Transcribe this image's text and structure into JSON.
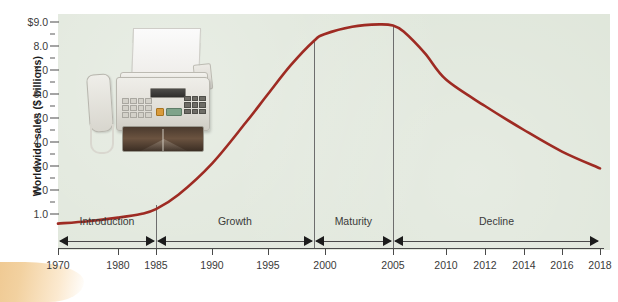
{
  "chart_data": {
    "type": "line",
    "title": "",
    "subtitle": "",
    "xlabel": "",
    "ylabel": "Worldwide sales ($ billions)",
    "grid": false,
    "legend": "none",
    "ylim": [
      0.0,
      9.0
    ],
    "y_ticks": [
      "$9.0",
      "8.0",
      "7.0",
      "6.0",
      "5.0",
      "4.0",
      "3.0",
      "2.0",
      "1.0"
    ],
    "y_tick_values": [
      9.0,
      8.0,
      7.0,
      6.0,
      5.0,
      4.0,
      3.0,
      2.0,
      1.0
    ],
    "y_minor_ticks": [
      8.5,
      7.5,
      6.5,
      5.5,
      4.5,
      3.5,
      2.5,
      1.5
    ],
    "x_ticks": [
      "1970",
      "1980",
      "1985",
      "1990",
      "1995",
      "2000",
      "2005",
      "2010",
      "2012",
      "2014",
      "2016",
      "2018"
    ],
    "x_tick_values": [
      1970,
      1980,
      1985,
      1990,
      1995,
      2000,
      2005,
      2010,
      2012,
      2014,
      2016,
      2018
    ],
    "series": [
      {
        "name": "Worldwide fax machine sales",
        "color": "#9e2b23",
        "x": [
          1970,
          1975,
          1980,
          1983,
          1985,
          1987,
          1990,
          1993,
          1995,
          1997,
          1999,
          2000,
          2002,
          2004,
          2005,
          2006,
          2008,
          2010,
          2012,
          2014,
          2016,
          2018
        ],
        "values": [
          0.6,
          0.7,
          0.85,
          1.0,
          1.2,
          1.8,
          3.1,
          4.8,
          6.0,
          7.2,
          8.2,
          8.5,
          8.8,
          8.9,
          8.85,
          8.6,
          7.7,
          6.6,
          5.5,
          4.5,
          3.6,
          2.9
        ]
      }
    ],
    "annotations": [
      {
        "name": "stage-introduction",
        "label": "Introduction",
        "x_start": 1970,
        "x_end": 1985
      },
      {
        "name": "stage-growth",
        "label": "Growth",
        "x_start": 1985,
        "x_end": 1999
      },
      {
        "name": "stage-maturity",
        "label": "Maturity",
        "x_start": 1999,
        "x_end": 2005
      },
      {
        "name": "stage-decline",
        "label": "Decline",
        "x_start": 2005,
        "x_end": 2018
      }
    ],
    "dividers": [
      1985,
      1999,
      2005
    ]
  },
  "axes": {
    "y_title": "Worldwide sales ($ billions)",
    "y_labels": [
      "$9.0",
      "8.0",
      "7.0",
      "6.0",
      "5.0",
      "4.0",
      "3.0",
      "2.0",
      "1.0"
    ],
    "x_labels": [
      "1970",
      "1980",
      "1985",
      "1990",
      "1995",
      "2000",
      "2005",
      "2010",
      "2012",
      "2014",
      "2016",
      "2018"
    ]
  },
  "stages": [
    {
      "label": "Introduction"
    },
    {
      "label": "Growth"
    },
    {
      "label": "Maturity"
    },
    {
      "label": "Decline"
    }
  ],
  "image": {
    "fax_machine_alt": "fax-machine-photo"
  },
  "colors": {
    "plot_background": "#dfe6da",
    "page_background": "#ffffff",
    "curve": "#9e2b23",
    "axis": "#4a4a4a",
    "label_text": "#3a3a3a",
    "accent_swoosh": "#e8b36a"
  }
}
